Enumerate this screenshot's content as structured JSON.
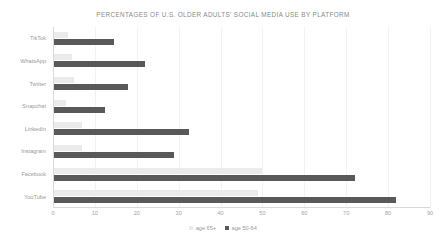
{
  "chart_data": {
    "type": "bar",
    "orientation": "horizontal",
    "title": "PERCENTAGES OF U.S. OLDER ADULTS' SOCIAL MEDIA USE BY PLATFORM",
    "xlabel": "",
    "ylabel": "",
    "xlim": [
      0,
      90
    ],
    "xticks": [
      0,
      10,
      20,
      30,
      40,
      50,
      60,
      70,
      80,
      90
    ],
    "xtick_labels": [
      "0",
      "10",
      "20",
      "30",
      "40",
      "50",
      "60",
      "70",
      "80",
      "90"
    ],
    "grid": true,
    "grid_axis": "x",
    "legend_position": "bottom",
    "categories": [
      "TikTok",
      "WhatsApp",
      "Twitter",
      "Snapchat",
      "LinkedIn",
      "Instagram",
      "Facebook",
      "YouTube"
    ],
    "series": [
      {
        "name": "age 65+",
        "color": "#ebebeb",
        "values": [
          3.5,
          4.5,
          5,
          3,
          7,
          7,
          50,
          49
        ]
      },
      {
        "name": "age 50-64",
        "color": "#595959",
        "values": [
          14.5,
          22,
          18,
          12.5,
          32.5,
          29,
          72,
          82
        ]
      }
    ]
  },
  "legend": {
    "entries": [
      {
        "label": "age 65+",
        "color": "#ebebeb"
      },
      {
        "label": "age 50-64",
        "color": "#595959"
      }
    ]
  }
}
